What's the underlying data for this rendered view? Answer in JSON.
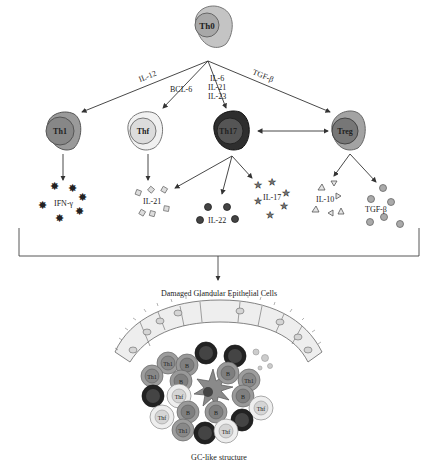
{
  "cells": {
    "th0": "Th0",
    "th1": "Th1",
    "thf": "Thf",
    "th17": "Th17",
    "treg": "Treg"
  },
  "signals": {
    "il12": "IL-12",
    "bcl6": "BCL-6",
    "il6": "IL-6",
    "il21": "IL-21",
    "il23": "IL-23",
    "tgfb": "TGF-β"
  },
  "cytokines": {
    "ifng": "IFN-γ",
    "il21": "IL-21",
    "il22": "IL-22",
    "il17": "IL-17",
    "il10": "IL-10",
    "tgfb": "TGF-β"
  },
  "tissue": {
    "title": "Damaged Glandular Epithelial Cells",
    "caption": "GC-like structure",
    "gc_labels": {
      "th1": "Th1",
      "thf": "Thf",
      "b": "B",
      "th17": "Th17",
      "center": "DC"
    }
  },
  "colors": {
    "th0_outer": "#b5b5b5",
    "th1_outer": "#8f8f8f",
    "thf_outer": "#e6e6e6",
    "th17_outer": "#2b2b2b",
    "treg_outer": "#9a9a9a",
    "line": "#333333"
  }
}
